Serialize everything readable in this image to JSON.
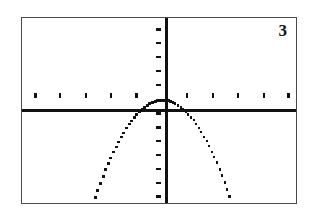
{
  "figure": {
    "label": "3",
    "kind": "graphing-calculator-screen",
    "frame_color": "#4a4a4a",
    "ink_color": "#111111",
    "background_color": "#ffffff"
  },
  "chart_data": {
    "type": "line",
    "title": "3",
    "subtitle": "",
    "xlabel": "",
    "ylabel": "",
    "curve_label": "downward parabola, vertex at origin",
    "equation": "y = -x^2",
    "vertex": [
      0,
      0
    ],
    "opens": "down",
    "grid": false,
    "legend": false,
    "axis_style": "calculator",
    "xlim": [
      -5.5,
      5.3
    ],
    "ylim": [
      -7.5,
      5.8
    ],
    "x_tick_step": 1,
    "y_tick_step": 1,
    "x_tick_values": [
      -5,
      -4,
      -3,
      -2,
      -1,
      1,
      2,
      3,
      4,
      5
    ],
    "y_tick_values": [
      5,
      4,
      3,
      2,
      1,
      -1,
      -2,
      -3,
      -4,
      -5,
      -6,
      -7
    ],
    "x": [
      -2.74,
      -2.6,
      -2.45,
      -2.3,
      -2.16,
      -2.01,
      -1.86,
      -1.72,
      -1.57,
      -1.42,
      -1.28,
      -1.13,
      -0.98,
      -0.84,
      -0.69,
      -0.54,
      -0.4,
      -0.25,
      -0.1,
      0.04,
      0.19,
      0.34,
      0.48,
      0.63,
      0.78,
      0.92,
      1.07,
      1.22,
      1.36,
      1.51,
      1.66,
      1.8,
      1.95,
      2.1,
      2.24,
      2.39,
      2.54,
      2.68
    ],
    "y": [
      -7.5,
      -6.76,
      -6.0,
      -5.29,
      -4.67,
      -4.04,
      -3.46,
      -2.96,
      -2.46,
      -2.02,
      -1.64,
      -1.28,
      -0.96,
      -0.71,
      -0.48,
      -0.29,
      -0.16,
      -0.06,
      -0.01,
      0.0,
      -0.04,
      -0.12,
      -0.23,
      -0.4,
      -0.61,
      -0.85,
      -1.14,
      -1.49,
      -1.85,
      -2.28,
      -2.76,
      -3.24,
      -3.8,
      -4.41,
      -5.02,
      -5.71,
      -6.45,
      -7.18
    ]
  }
}
